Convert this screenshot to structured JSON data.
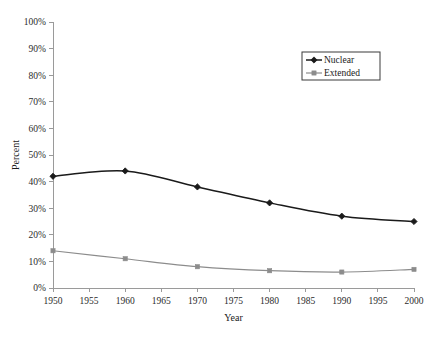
{
  "chart_data": {
    "type": "line",
    "title": "",
    "xlabel": "Year",
    "ylabel": "Percent",
    "x": [
      1950,
      1960,
      1970,
      1980,
      1990,
      2000
    ],
    "xlim": [
      1950,
      2000
    ],
    "ylim": [
      0,
      100
    ],
    "xticks": [
      1950,
      1955,
      1960,
      1965,
      1970,
      1975,
      1980,
      1985,
      1990,
      1995,
      2000
    ],
    "xtick_labels": [
      "1950",
      "1955",
      "1960",
      "1965",
      "1970",
      "1975",
      "1980",
      "1985",
      "1990",
      "1995",
      "2000"
    ],
    "yticks": [
      0,
      10,
      20,
      30,
      40,
      50,
      60,
      70,
      80,
      90,
      100
    ],
    "ytick_labels": [
      "0%",
      "10%",
      "20%",
      "30%",
      "40%",
      "50%",
      "60%",
      "70%",
      "80%",
      "90%",
      "100%"
    ],
    "grid": false,
    "legend_position": "upper-right",
    "series": [
      {
        "name": "Nuclear",
        "values": [
          42,
          44,
          38,
          32,
          27,
          25
        ],
        "color": "#1a1a1a",
        "marker": "diamond"
      },
      {
        "name": "Extended",
        "values": [
          14,
          11,
          8,
          6.5,
          6,
          7
        ],
        "color": "#8c8c8c",
        "marker": "square"
      }
    ]
  },
  "legend": {
    "items": [
      {
        "label": "Nuclear"
      },
      {
        "label": "Extended"
      }
    ]
  }
}
